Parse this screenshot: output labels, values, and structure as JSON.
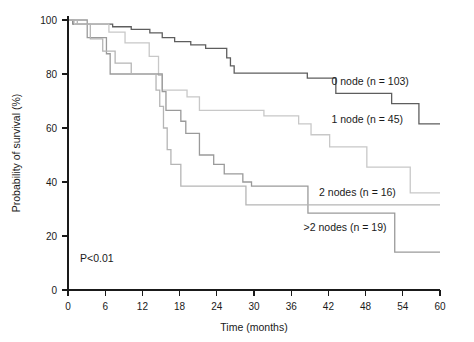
{
  "chart_data": {
    "type": "line",
    "title": "",
    "xlabel": "Time (months)",
    "ylabel": "Probability of survival (%)",
    "xlim": [
      0,
      60
    ],
    "ylim": [
      0,
      100
    ],
    "xticks": [
      0,
      6,
      12,
      18,
      24,
      30,
      36,
      42,
      48,
      54,
      60
    ],
    "yticks": [
      0,
      20,
      40,
      60,
      80,
      100
    ],
    "grid": false,
    "legend_position": "inline-right-of-curves",
    "annotations": [
      {
        "name": "p-value",
        "text": "P<0.01",
        "x": 3.5,
        "y": 9
      }
    ],
    "series": [
      {
        "name": "0 node (n = 103)",
        "label": "0 node (n = 103)",
        "group": "0 node",
        "n": 103,
        "color": "#5e5e5e",
        "label_x": 42.5,
        "label_y": 76,
        "steps": [
          [
            0,
            100
          ],
          [
            0.8,
            98.5
          ],
          [
            6.5,
            98.5
          ],
          [
            7.2,
            97.5
          ],
          [
            9.5,
            97.5
          ],
          [
            10.2,
            96.5
          ],
          [
            12.5,
            96.5
          ],
          [
            13.2,
            95.2
          ],
          [
            14.5,
            95.2
          ],
          [
            15.2,
            93.5
          ],
          [
            16.5,
            93.5
          ],
          [
            17.2,
            92.0
          ],
          [
            19.0,
            92.0
          ],
          [
            19.8,
            90.8
          ],
          [
            21.5,
            90.8
          ],
          [
            22.2,
            89.5
          ],
          [
            25.0,
            89.5
          ],
          [
            25.6,
            86.0
          ],
          [
            26.2,
            83.0
          ],
          [
            26.8,
            80.3
          ],
          [
            38.0,
            80.3
          ],
          [
            38.6,
            78.5
          ],
          [
            42.5,
            78.5
          ],
          [
            43.2,
            72.8
          ],
          [
            51.5,
            72.8
          ],
          [
            52.2,
            69.0
          ],
          [
            56.0,
            69.0
          ],
          [
            56.6,
            61.5
          ],
          [
            60,
            61.5
          ]
        ],
        "final_value": 61.5
      },
      {
        "name": "1 node (n = 45)",
        "label": "1 node (n = 45)",
        "group": "1 node",
        "n": 45,
        "color": "#c8c8c8",
        "label_x": 42.5,
        "label_y": 62,
        "steps": [
          [
            0,
            100
          ],
          [
            1.0,
            98.5
          ],
          [
            6.0,
            98.5
          ],
          [
            6.6,
            95.5
          ],
          [
            8.5,
            95.5
          ],
          [
            9.2,
            91.5
          ],
          [
            12.5,
            91.5
          ],
          [
            13.1,
            86.5
          ],
          [
            14.0,
            86.5
          ],
          [
            14.6,
            79.5
          ],
          [
            15.2,
            74.0
          ],
          [
            18.5,
            74.0
          ],
          [
            19.2,
            71.5
          ],
          [
            20.5,
            71.5
          ],
          [
            21.2,
            66.5
          ],
          [
            31.0,
            66.5
          ],
          [
            31.6,
            64.5
          ],
          [
            36.5,
            64.5
          ],
          [
            37.2,
            61.5
          ],
          [
            38.5,
            61.5
          ],
          [
            39.2,
            57.5
          ],
          [
            41.5,
            57.5
          ],
          [
            42.2,
            53.0
          ],
          [
            47.5,
            53.0
          ],
          [
            48.2,
            45.5
          ],
          [
            54.5,
            45.5
          ],
          [
            55.2,
            36.0
          ],
          [
            60,
            36.0
          ]
        ],
        "final_value": 36.0
      },
      {
        "name": "2 nodes (n = 16)",
        "label": "2 nodes (n = 16)",
        "group": "2 nodes",
        "n": 16,
        "color": "#9a9a9a",
        "label_x": 40.5,
        "label_y": 35,
        "steps": [
          [
            0,
            100
          ],
          [
            2.5,
            100
          ],
          [
            3.1,
            93.5
          ],
          [
            5.5,
            93.5
          ],
          [
            6.2,
            87.5
          ],
          [
            6.8,
            80.0
          ],
          [
            14.5,
            80.0
          ],
          [
            15.2,
            73.5
          ],
          [
            15.8,
            66.5
          ],
          [
            17.5,
            66.5
          ],
          [
            18.2,
            62.5
          ],
          [
            19.0,
            58.0
          ],
          [
            20.5,
            58.0
          ],
          [
            21.2,
            50.0
          ],
          [
            22.8,
            50.0
          ],
          [
            23.5,
            46.5
          ],
          [
            24.5,
            46.5
          ],
          [
            25.2,
            43.0
          ],
          [
            27.5,
            43.0
          ],
          [
            28.2,
            40.0
          ],
          [
            29.0,
            40.0
          ],
          [
            29.6,
            38.5
          ],
          [
            38.0,
            38.5
          ],
          [
            38.7,
            28.5
          ],
          [
            52.0,
            28.5
          ],
          [
            52.7,
            14.0
          ],
          [
            60,
            14.0
          ]
        ],
        "final_value": 14.0
      },
      {
        "name": ">2 nodes (n = 19)",
        "label": ">2 nodes (n = 19)",
        "group": ">2 nodes",
        "n": 19,
        "color": "#b5b5b5",
        "label_x": 38.0,
        "label_y": 22,
        "steps": [
          [
            0,
            100
          ],
          [
            1.5,
            98.5
          ],
          [
            3.0,
            98.5
          ],
          [
            3.6,
            93.0
          ],
          [
            5.0,
            93.0
          ],
          [
            5.6,
            88.5
          ],
          [
            7.0,
            88.5
          ],
          [
            7.6,
            84.0
          ],
          [
            9.5,
            84.0
          ],
          [
            10.2,
            80.0
          ],
          [
            13.5,
            80.0
          ],
          [
            14.2,
            74.0
          ],
          [
            14.8,
            68.0
          ],
          [
            15.4,
            60.0
          ],
          [
            16.0,
            52.0
          ],
          [
            16.6,
            46.5
          ],
          [
            17.5,
            46.5
          ],
          [
            18.2,
            38.5
          ],
          [
            28.0,
            38.5
          ],
          [
            28.7,
            31.5
          ],
          [
            38.0,
            31.5
          ],
          [
            38.7,
            31.5
          ],
          [
            60,
            31.5
          ]
        ],
        "final_value": 31.5
      }
    ]
  },
  "figure": {
    "pvalue": "P<0.01",
    "x_axis_title": "Time (months)",
    "y_axis_title": "Probability of survival (%)"
  }
}
